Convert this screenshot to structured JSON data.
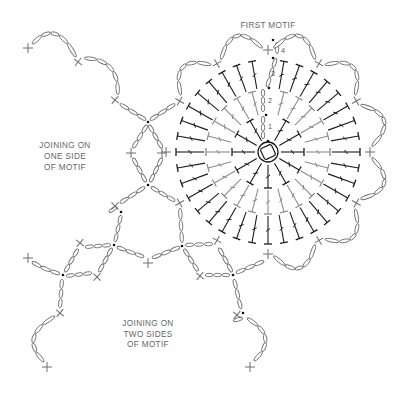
{
  "labels": {
    "first_motif": "FIRST MOTIF",
    "one_side": [
      "JOINING ON",
      "ONE SIDE",
      "OF MOTIF"
    ],
    "two_sides": [
      "JOINING ON",
      "TWO SIDES",
      "OF MOTIF"
    ]
  },
  "colors": {
    "stitch_dark": "#1c1c1c",
    "stitch_light": "#8c8c8c",
    "chain": "#6e6e6e",
    "text": "#666666"
  },
  "motif": {
    "center": [
      268,
      152
    ],
    "ring_radius": 10,
    "sc_radius": 102,
    "sc_angles": [
      0,
      30,
      60,
      90,
      120,
      150,
      180,
      210,
      240,
      270,
      300,
      330
    ],
    "rounds": [
      {
        "round": 1,
        "count": 12,
        "r0": 13,
        "r1": 36,
        "color": "#1c1c1c",
        "stitch": "dc"
      },
      {
        "round": 2,
        "count": 24,
        "r0": 38,
        "r1": 62,
        "color": "#8c8c8c",
        "stitch": "dc"
      },
      {
        "round": 3,
        "count": 36,
        "r0": 64,
        "r1": 92,
        "color": "#1c1c1c",
        "stitch": "dc"
      }
    ],
    "round_labels": [
      {
        "text": "1"
      },
      {
        "text": "2"
      },
      {
        "text": "3"
      },
      {
        "text": "4"
      }
    ],
    "round_start_chains": [
      {
        "from": [
          263,
          139
        ],
        "to": [
          263,
          116
        ],
        "n": 3
      },
      {
        "from": [
          263,
          112
        ],
        "to": [
          263,
          89
        ],
        "n": 3
      },
      {
        "from": [
          267,
          87
        ],
        "to": [
          276,
          58
        ],
        "n": 3
      },
      {
        "from": [
          277,
          54
        ],
        "to": [
          277,
          42
        ],
        "n": 1
      }
    ],
    "slip_stitch_dots": [
      [
        268,
        141
      ],
      [
        266,
        115
      ],
      [
        269,
        88
      ],
      [
        273,
        58
      ],
      [
        273,
        40
      ]
    ],
    "scallop_start_angles": [
      300,
      330,
      0,
      30,
      60,
      90,
      120,
      150
    ],
    "scallop_ctrl_radius": 140,
    "scallop_chains": 5
  },
  "joins": {
    "chains": [
      {
        "from": [
          32,
          44
        ],
        "ctrl": [
          56,
          16
        ],
        "to": [
          76,
          57
        ],
        "n": 5
      },
      {
        "from": [
          84,
          58
        ],
        "ctrl": [
          120,
          58
        ],
        "to": [
          118,
          95
        ],
        "n": 5
      },
      {
        "from": [
          120,
          104
        ],
        "to": [
          146,
          120
        ],
        "n": 3
      },
      {
        "from": [
          150,
          120
        ],
        "to": [
          175,
          104
        ],
        "n": 3
      },
      {
        "from": [
          147,
          125
        ],
        "to": [
          133,
          148
        ],
        "n": 3
      },
      {
        "from": [
          149,
          125
        ],
        "to": [
          162,
          148
        ],
        "n": 3
      },
      {
        "from": [
          133,
          158
        ],
        "to": [
          146,
          182
        ],
        "n": 3
      },
      {
        "from": [
          162,
          158
        ],
        "to": [
          150,
          182
        ],
        "n": 3
      },
      {
        "from": [
          145,
          187
        ],
        "to": [
          120,
          203
        ],
        "n": 3
      },
      {
        "from": [
          151,
          187
        ],
        "to": [
          175,
          201
        ],
        "n": 3
      },
      {
        "from": [
          121,
          215
        ],
        "to": [
          115,
          242
        ],
        "n": 3
      },
      {
        "from": [
          85,
          247
        ],
        "to": [
          111,
          245
        ],
        "n": 3
      },
      {
        "from": [
          117,
          247
        ],
        "to": [
          144,
          257
        ],
        "n": 3
      },
      {
        "from": [
          152,
          258
        ],
        "to": [
          180,
          247
        ],
        "n": 3
      },
      {
        "from": [
          180,
          208
        ],
        "to": [
          182,
          243
        ],
        "n": 3
      },
      {
        "from": [
          112,
          248
        ],
        "to": [
          99,
          272
        ],
        "n": 3
      },
      {
        "from": [
          78,
          249
        ],
        "to": [
          65,
          272
        ],
        "n": 3
      },
      {
        "from": [
          32,
          262
        ],
        "ctrl": [
          45,
          270
        ],
        "to": [
          60,
          274
        ],
        "n": 3
      },
      {
        "from": [
          66,
          276
        ],
        "to": [
          92,
          273
        ],
        "n": 3
      },
      {
        "from": [
          62,
          279
        ],
        "to": [
          60,
          308
        ],
        "n": 3
      },
      {
        "from": [
          55,
          316
        ],
        "ctrl": [
          17,
          337
        ],
        "to": [
          44,
          362
        ],
        "n": 5
      },
      {
        "from": [
          185,
          245
        ],
        "to": [
          213,
          244
        ],
        "n": 3
      },
      {
        "from": [
          184,
          249
        ],
        "to": [
          198,
          271
        ],
        "n": 3
      },
      {
        "from": [
          205,
          275
        ],
        "to": [
          230,
          275
        ],
        "n": 3
      },
      {
        "from": [
          219,
          248
        ],
        "to": [
          232,
          272
        ],
        "n": 3
      },
      {
        "from": [
          236,
          273
        ],
        "to": [
          264,
          261
        ],
        "n": 3
      },
      {
        "from": [
          234,
          279
        ],
        "to": [
          241,
          309
        ],
        "n": 3
      },
      {
        "from": [
          247,
          318
        ],
        "ctrl": [
          281,
          337
        ],
        "to": [
          254,
          361
        ],
        "n": 5
      },
      {
        "from": [
          109,
          212
        ],
        "to": [
          117,
          207
        ],
        "n": 1
      },
      {
        "from": [
          233,
          321
        ],
        "to": [
          243,
          318
        ],
        "n": 1
      }
    ],
    "sc_nodes": [
      {
        "pos": [
          28,
          48
        ],
        "rot": 0
      },
      {
        "pos": [
          78,
          62
        ],
        "rot": 38
      },
      {
        "pos": [
          115,
          100
        ],
        "rot": 40
      },
      {
        "pos": [
          131,
          153
        ],
        "rot": 0
      },
      {
        "pos": [
          162,
          153
        ],
        "rot": 0
      },
      {
        "pos": [
          115,
          206
        ],
        "rot": 45
      },
      {
        "pos": [
          80,
          243
        ],
        "rot": 40
      },
      {
        "pos": [
          97,
          277
        ],
        "rot": 45
      },
      {
        "pos": [
          60,
          313
        ],
        "rot": 40
      },
      {
        "pos": [
          28,
          258
        ],
        "rot": 0
      },
      {
        "pos": [
          148,
          263
        ],
        "rot": 0
      },
      {
        "pos": [
          47,
          367
        ],
        "rot": 0
      },
      {
        "pos": [
          200,
          276
        ],
        "rot": 40
      },
      {
        "pos": [
          237,
          315
        ],
        "rot": 40
      },
      {
        "pos": [
          250,
          367
        ],
        "rot": 0
      }
    ],
    "dots": [
      [
        148,
        122
      ],
      [
        148,
        185
      ],
      [
        121,
        212
      ],
      [
        114,
        245
      ],
      [
        182,
        246
      ],
      [
        63,
        275
      ],
      [
        233,
        275
      ],
      [
        243,
        313
      ]
    ]
  }
}
